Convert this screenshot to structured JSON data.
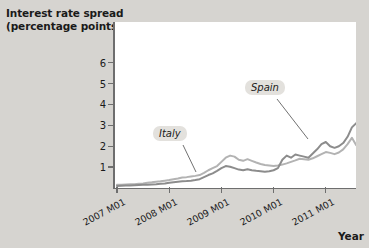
{
  "chart_data": {
    "type": "line",
    "title": "Interest rate spread (percentage points)",
    "ylabel_line1": "Interest rate spread",
    "ylabel_line2": "(percentage points)",
    "xlabel": "Year",
    "ylim": [
      0,
      6.5
    ],
    "yticks": [
      1,
      2,
      3,
      4,
      5,
      6
    ],
    "ytick_labels": [
      "1",
      "2",
      "3",
      "4",
      "5",
      "6"
    ],
    "xlim": [
      "2007 M01",
      "2011 M12"
    ],
    "xticks": [
      "2007 M01",
      "2008 M01",
      "2009 M01",
      "2010 M01",
      "2011 M01"
    ],
    "grid": false,
    "legend_position": "inline-callouts",
    "annotations": [
      {
        "label": "Italy",
        "x": 2008.05,
        "y": 2.05
      },
      {
        "label": "Spain",
        "x": 2009.95,
        "y": 3.2
      }
    ],
    "colors": {
      "italy": "#b3b3b3",
      "spain": "#8c8c8c",
      "axis": "#6e6e6e",
      "plot_background": "#ffffff",
      "figure_background": "#d6d4d0",
      "callout_background": "#e3e1dd",
      "text": "#1a1a1a"
    },
    "series": [
      {
        "name": "Italy",
        "color": "#b3b3b3",
        "x": [
          2007.0,
          2007.083,
          2007.167,
          2007.25,
          2007.333,
          2007.417,
          2007.5,
          2007.583,
          2007.667,
          2007.75,
          2007.833,
          2007.917,
          2008.0,
          2008.083,
          2008.167,
          2008.25,
          2008.333,
          2008.417,
          2008.5,
          2008.583,
          2008.667,
          2008.75,
          2008.833,
          2008.917,
          2009.0,
          2009.083,
          2009.167,
          2009.25,
          2009.333,
          2009.417,
          2009.5,
          2009.583,
          2009.667,
          2009.75,
          2009.833,
          2009.917,
          2010.0,
          2010.083,
          2010.167,
          2010.25,
          2010.333,
          2010.417,
          2010.5,
          2010.583,
          2010.667,
          2010.75,
          2010.833,
          2010.917,
          2011.0,
          2011.083,
          2011.167,
          2011.25,
          2011.333,
          2011.417,
          2011.5,
          2011.583,
          2011.667,
          2011.75,
          2011.833,
          2011.917
        ],
        "values": [
          0.15,
          0.16,
          0.17,
          0.18,
          0.18,
          0.2,
          0.22,
          0.25,
          0.27,
          0.3,
          0.32,
          0.35,
          0.38,
          0.42,
          0.45,
          0.5,
          0.52,
          0.55,
          0.58,
          0.62,
          0.72,
          0.85,
          0.95,
          1.05,
          1.25,
          1.45,
          1.55,
          1.5,
          1.35,
          1.3,
          1.38,
          1.3,
          1.22,
          1.15,
          1.1,
          1.08,
          1.05,
          1.08,
          1.12,
          1.18,
          1.25,
          1.32,
          1.4,
          1.38,
          1.35,
          1.42,
          1.52,
          1.62,
          1.72,
          1.68,
          1.62,
          1.7,
          1.85,
          2.1,
          2.4,
          2.05,
          2.6,
          3.4,
          4.1,
          5.2
        ]
      },
      {
        "name": "Spain",
        "color": "#8c8c8c",
        "x": [
          2007.0,
          2007.083,
          2007.167,
          2007.25,
          2007.333,
          2007.417,
          2007.5,
          2007.583,
          2007.667,
          2007.75,
          2007.833,
          2007.917,
          2008.0,
          2008.083,
          2008.167,
          2008.25,
          2008.333,
          2008.417,
          2008.5,
          2008.583,
          2008.667,
          2008.75,
          2008.833,
          2008.917,
          2009.0,
          2009.083,
          2009.167,
          2009.25,
          2009.333,
          2009.417,
          2009.5,
          2009.583,
          2009.667,
          2009.75,
          2009.833,
          2009.917,
          2010.0,
          2010.083,
          2010.167,
          2010.25,
          2010.333,
          2010.417,
          2010.5,
          2010.583,
          2010.667,
          2010.75,
          2010.833,
          2010.917,
          2011.0,
          2011.083,
          2011.167,
          2011.25,
          2011.333,
          2011.417,
          2011.5,
          2011.583,
          2011.667,
          2011.75,
          2011.833,
          2011.917
        ],
        "values": [
          0.1,
          0.11,
          0.12,
          0.12,
          0.13,
          0.14,
          0.15,
          0.16,
          0.17,
          0.18,
          0.2,
          0.22,
          0.25,
          0.28,
          0.3,
          0.32,
          0.33,
          0.35,
          0.38,
          0.42,
          0.52,
          0.62,
          0.7,
          0.82,
          0.95,
          1.05,
          1.02,
          0.95,
          0.88,
          0.85,
          0.9,
          0.85,
          0.82,
          0.8,
          0.78,
          0.8,
          0.85,
          0.95,
          1.35,
          1.55,
          1.45,
          1.6,
          1.55,
          1.5,
          1.45,
          1.65,
          1.85,
          2.1,
          2.2,
          2.0,
          1.92,
          2.0,
          2.15,
          2.45,
          2.9,
          3.1,
          3.2,
          4.2,
          4.3,
          4.85
        ]
      }
    ]
  }
}
